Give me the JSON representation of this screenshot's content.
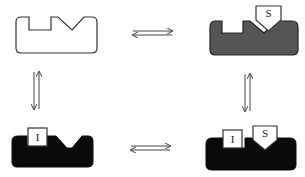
{
  "diagram": {
    "type": "equilibrium-scheme",
    "states": [
      {
        "id": "free",
        "position": "top-left",
        "fill": "#ffffff",
        "stroke": "#333333",
        "bound": []
      },
      {
        "id": "substrate-bound",
        "position": "top-right",
        "fill": "#555555",
        "stroke": "#222222",
        "bound": [
          "S"
        ]
      },
      {
        "id": "inhibitor-bound",
        "position": "bottom-left",
        "fill": "#0a0a0a",
        "stroke": "#0a0a0a",
        "bound": [
          "I"
        ]
      },
      {
        "id": "inhibitor-substrate-bound",
        "position": "bottom-right",
        "fill": "#0a0a0a",
        "stroke": "#0a0a0a",
        "bound": [
          "I",
          "S"
        ]
      }
    ],
    "labels": {
      "substrate": "S",
      "inhibitor": "I"
    },
    "arrows": [
      {
        "id": "top",
        "from": "free",
        "to": "substrate-bound",
        "kind": "equilibrium"
      },
      {
        "id": "bottom",
        "from": "inhibitor-bound",
        "to": "inhibitor-substrate-bound",
        "kind": "equilibrium"
      },
      {
        "id": "left",
        "from": "free",
        "to": "inhibitor-bound",
        "kind": "equilibrium"
      },
      {
        "id": "right",
        "from": "substrate-bound",
        "to": "inhibitor-substrate-bound",
        "kind": "equilibrium"
      }
    ],
    "colors": {
      "outline": "#333333",
      "gray_fill": "#555555",
      "black_fill": "#0a0a0a",
      "arrow": "#444444"
    }
  }
}
